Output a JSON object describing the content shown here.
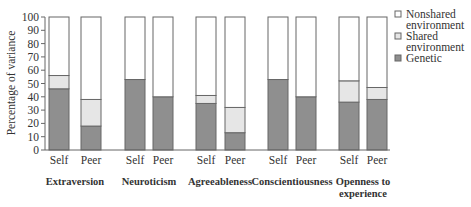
{
  "chart_data": {
    "type": "bar",
    "stacked": true,
    "title": "",
    "xlabel": "",
    "ylabel": "Percentage of variance",
    "ylim": [
      0,
      100
    ],
    "yticks": [
      0,
      10,
      20,
      30,
      40,
      50,
      60,
      70,
      80,
      90,
      100
    ],
    "grid": false,
    "legend_position": "right-top",
    "groups": [
      "Extraversion",
      "Neuroticism",
      "Agreeableness",
      "Conscientiousness",
      "Openness to experience"
    ],
    "group_labels": [
      [
        "Extraversion"
      ],
      [
        "Neuroticism"
      ],
      [
        "Agreeableness"
      ],
      [
        "Conscientiousness"
      ],
      [
        "Openness to",
        "experience"
      ]
    ],
    "sub_categories": [
      "Self",
      "Peer"
    ],
    "categories": [
      "Extraversion Self",
      "Extraversion Peer",
      "Neuroticism Self",
      "Neuroticism Peer",
      "Agreeableness Self",
      "Agreeableness Peer",
      "Conscientiousness Self",
      "Conscientiousness Peer",
      "Openness Self",
      "Openness Peer"
    ],
    "series": [
      {
        "name": "Genetic",
        "color": "#8f8f8f",
        "values": [
          46,
          18,
          53,
          40,
          35,
          13,
          53,
          40,
          36,
          38
        ]
      },
      {
        "name": "Shared environment",
        "color": "#e6e6e6",
        "values": [
          10,
          20,
          0,
          0,
          6,
          19,
          0,
          0,
          16,
          9
        ]
      },
      {
        "name": "Nonshared environment",
        "color": "#ffffff",
        "values": [
          44,
          62,
          47,
          60,
          59,
          68,
          47,
          60,
          48,
          53
        ]
      }
    ],
    "legend": [
      "Nonshared environment",
      "Shared environment",
      "Genetic"
    ]
  }
}
